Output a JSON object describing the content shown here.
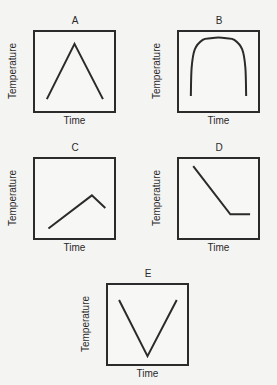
{
  "chart_data": [
    {
      "id": "a",
      "type": "line",
      "title": "A",
      "xlabel": "Time",
      "ylabel": "Temperature",
      "xlim": [
        0,
        1
      ],
      "ylim": [
        0,
        1
      ],
      "grid": false,
      "curve": "polyline",
      "x": [
        0.15,
        0.5,
        0.86
      ],
      "y": [
        0.15,
        0.85,
        0.15
      ]
    },
    {
      "id": "b",
      "type": "line",
      "title": "B",
      "xlabel": "Time",
      "ylabel": "Temperature",
      "xlim": [
        0,
        1
      ],
      "ylim": [
        0,
        1
      ],
      "grid": false,
      "curve": "smooth-arch",
      "x": [
        0.15,
        0.16,
        0.2,
        0.3,
        0.4,
        0.5,
        0.6,
        0.7,
        0.8,
        0.84,
        0.85
      ],
      "y": [
        0.19,
        0.55,
        0.78,
        0.9,
        0.92,
        0.93,
        0.92,
        0.9,
        0.78,
        0.55,
        0.19
      ]
    },
    {
      "id": "c",
      "type": "line",
      "title": "C",
      "xlabel": "Time",
      "ylabel": "Temperature",
      "xlim": [
        0,
        1
      ],
      "ylim": [
        0,
        1
      ],
      "grid": false,
      "curve": "polyline",
      "x": [
        0.17,
        0.72,
        0.89
      ],
      "y": [
        0.12,
        0.54,
        0.38
      ]
    },
    {
      "id": "d",
      "type": "line",
      "title": "D",
      "xlabel": "Time",
      "ylabel": "Temperature",
      "xlim": [
        0,
        1
      ],
      "ylim": [
        0,
        1
      ],
      "grid": false,
      "curve": "polyline",
      "x": [
        0.18,
        0.65,
        0.9
      ],
      "y": [
        0.91,
        0.3,
        0.3
      ]
    },
    {
      "id": "e",
      "type": "line",
      "title": "E",
      "xlabel": "Time",
      "ylabel": "Temperature",
      "xlim": [
        0,
        1
      ],
      "ylim": [
        0,
        1
      ],
      "grid": false,
      "curve": "polyline",
      "x": [
        0.14,
        0.5,
        0.87
      ],
      "y": [
        0.81,
        0.1,
        0.81
      ]
    }
  ],
  "colors": {
    "line": "#2b2b2b",
    "frame": "#2b2b2b",
    "background": "#f4f4f2"
  }
}
